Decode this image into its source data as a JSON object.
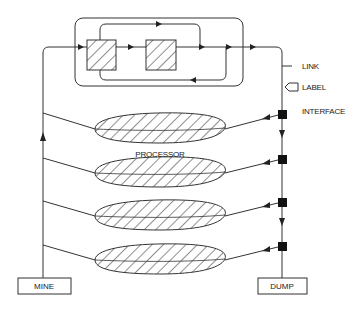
{
  "diagram": {
    "legend": {
      "link_label": "LINK",
      "label_label": "LABEL",
      "interface_label": "INTERFACE"
    },
    "processor_label": "PROCESSOR",
    "source_label": "MINE",
    "sink_label": "DUMP",
    "processor_count": 4,
    "interface_count": 4,
    "colors": {
      "stroke": "#333333",
      "fill": "#ffffff",
      "interface": "#111111"
    }
  }
}
